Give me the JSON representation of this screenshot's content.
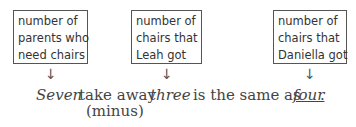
{
  "boxes": [
    {
      "lines": [
        "number of",
        "parents who",
        "need chairs"
      ]
    },
    {
      "lines": [
        "number of",
        "chairs that",
        "Leah got"
      ]
    },
    {
      "lines": [
        "number of",
        "chairs that",
        "Daniella got"
      ]
    }
  ],
  "arrow_glyph": "↓",
  "sentence": {
    "word1": "Seven",
    "op": "take away",
    "op_note": "(minus)",
    "word2": "three",
    "relation": "is the same as",
    "word3": "four",
    "end": "."
  }
}
